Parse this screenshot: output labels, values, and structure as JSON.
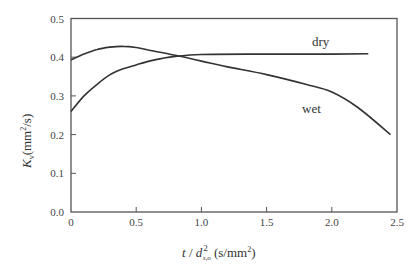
{
  "chart_data": {
    "type": "line",
    "title": "",
    "xlabel": "t / d²s,o (s/mm²)",
    "ylabel": "Kv (mm²/s)",
    "xlim": [
      0,
      2.5
    ],
    "ylim": [
      0.0,
      0.5
    ],
    "grid": false,
    "legend": "inline labels",
    "x_ticks": [
      "0",
      "0.5",
      "1.0",
      "1.5",
      "2.0",
      "2.5"
    ],
    "y_ticks": [
      "0.0",
      "0.1",
      "0.2",
      "0.3",
      "0.4",
      "0.5"
    ],
    "series": [
      {
        "name": "dry",
        "x": [
          0,
          0.1,
          0.2,
          0.3,
          0.4,
          0.5,
          0.6,
          0.7,
          0.8,
          1.0,
          1.5,
          2.0,
          2.28
        ],
        "values": [
          0.26,
          0.3,
          0.33,
          0.355,
          0.37,
          0.38,
          0.39,
          0.397,
          0.402,
          0.407,
          0.408,
          0.408,
          0.409
        ]
      },
      {
        "name": "wet",
        "x": [
          0,
          0.1,
          0.2,
          0.3,
          0.4,
          0.5,
          0.6,
          0.8,
          1.0,
          1.2,
          1.5,
          1.8,
          2.0,
          2.2,
          2.45
        ],
        "values": [
          0.393,
          0.408,
          0.42,
          0.426,
          0.428,
          0.425,
          0.418,
          0.405,
          0.39,
          0.375,
          0.355,
          0.33,
          0.31,
          0.27,
          0.2
        ]
      }
    ]
  },
  "labels": {
    "dry": "dry",
    "wet": "wet",
    "x_axis": {
      "t": "t",
      "slash": " / ",
      "d": "d",
      "sup": "2",
      "sub": "s,o",
      "units": " (s/mm",
      "units_sup": "2",
      "units_end": ")"
    },
    "y_axis": {
      "K": "K",
      "sub": "v",
      "units": "(mm",
      "units_sup": "2",
      "units_end": "/s)"
    }
  },
  "colors": {
    "line": "#333333",
    "axis": "#555555",
    "background": "#ffffff"
  }
}
